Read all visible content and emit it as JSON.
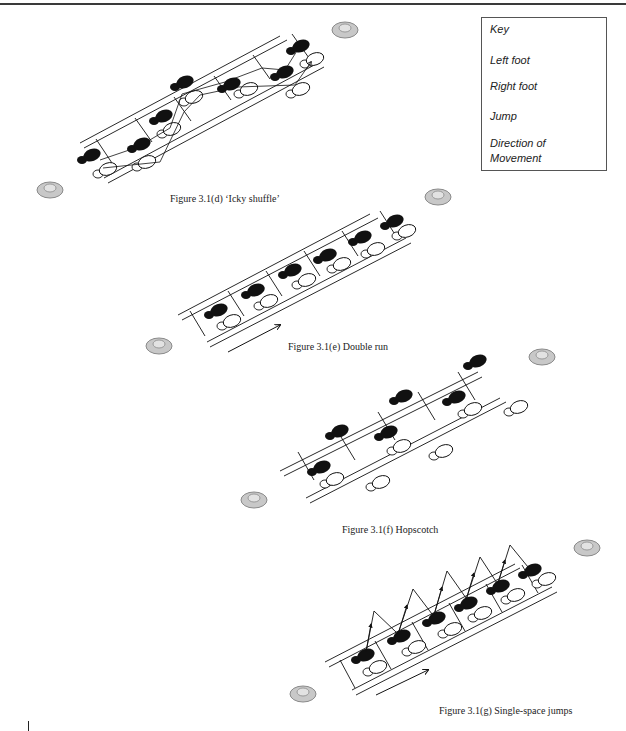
{
  "key": {
    "title": "Key",
    "items": [
      {
        "label": "Left foot",
        "icon": "left-foot-icon"
      },
      {
        "label": "Right foot",
        "icon": "right-foot-icon"
      },
      {
        "label": "Jump",
        "icon": "jump-icon"
      },
      {
        "label": "Direction of",
        "label2": "Movement",
        "icon": "direction-arrow-icon"
      }
    ]
  },
  "figures": [
    {
      "id": "3.1(d)",
      "caption": "Figure 3.1(d) ‘Icky shuffle’"
    },
    {
      "id": "3.1(e)",
      "caption": "Figure 3.1(e) Double run"
    },
    {
      "id": "3.1(f)",
      "caption": "Figure 3.1(f) Hopscotch"
    },
    {
      "id": "3.1(g)",
      "caption": "Figure 3.1(g) Single-space jumps"
    }
  ],
  "colors": {
    "ink": "#111111",
    "cone_fill": "#c8c8c8",
    "cone_inner": "#e2e2e2",
    "cone_stroke": "#8a8a8a"
  }
}
